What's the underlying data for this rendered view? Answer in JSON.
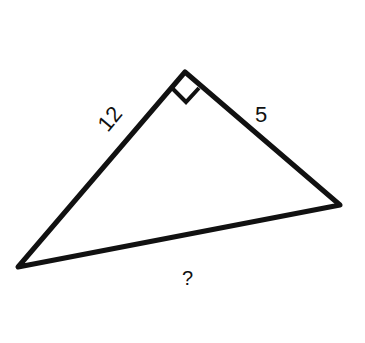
{
  "diagram": {
    "type": "right-triangle",
    "vertices": {
      "top": [
        185,
        72
      ],
      "left": [
        18,
        267
      ],
      "right": [
        340,
        205
      ]
    },
    "right_angle_at": "top",
    "sides": {
      "left_leg": {
        "label": "12"
      },
      "right_leg": {
        "label": "5"
      },
      "hypotenuse": {
        "label": "?"
      }
    },
    "stroke_color": "#111111",
    "background": "#ffffff"
  }
}
